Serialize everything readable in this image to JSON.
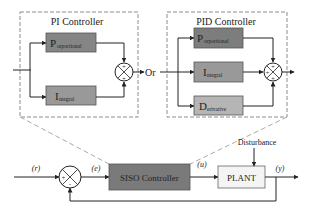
{
  "colors": {
    "background": "#ffffff",
    "line": "#222222",
    "dashed_border": "#8c8c8c",
    "proportional_fill": "#858585",
    "integral_fill": "#999999",
    "derivative_fill": "#b5b5b5",
    "siso_fill": "#7a7a7a",
    "plant_fill": "#f4f4f4"
  },
  "pi_controller": {
    "title": "PI Controller",
    "blocks": [
      {
        "main": "P",
        "sub": "orportional"
      },
      {
        "main": "I",
        "sub": "ntegral"
      }
    ],
    "sum_signs": [
      "+",
      "+"
    ]
  },
  "connector": {
    "label": "Or"
  },
  "pid_controller": {
    "title": "PID Controller",
    "blocks": [
      {
        "main": "P",
        "sub": "orportional"
      },
      {
        "main": "I",
        "sub": "ntegral"
      },
      {
        "main": "D",
        "sub": "erivative"
      }
    ],
    "sum_signs": [
      "+",
      "+",
      "+"
    ]
  },
  "loop": {
    "reference_label": "(r)",
    "error_label": "(e)",
    "control_label": "(u)",
    "output_label": "(y)",
    "sum_signs": [
      "+",
      "-"
    ],
    "controller_label": "SISO Controller",
    "plant_label": "PLANT",
    "disturbance_label": "Disturbance"
  }
}
